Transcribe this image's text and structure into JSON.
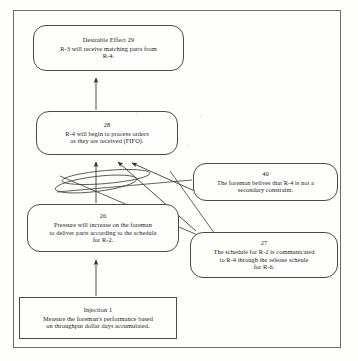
{
  "document": {
    "type": "future-reality-tree-diagram",
    "frame_border_color": "#6b6b6b",
    "node_border_color": "#4a4a4a",
    "text_color": "#1c1c1c",
    "background_color": "#fefefd"
  },
  "nodes": [
    {
      "key": "node-29",
      "id_label": "Desirable Effect 29",
      "shape": "rounded-rectangle",
      "lines": [
        "R-3 will receive matching parts from",
        "R-4."
      ]
    },
    {
      "key": "node-28",
      "id_label": "28",
      "shape": "rounded-rectangle",
      "lines": [
        "R-4 will begin to process orders",
        "as they are received (FIFO)."
      ]
    },
    {
      "key": "node-40",
      "id_label": "40",
      "shape": "rounded-rectangle",
      "lines": [
        "The foreman belives that R-4 is not a",
        "secondary constraint."
      ]
    },
    {
      "key": "node-26",
      "id_label": "26",
      "shape": "rounded-rectangle",
      "lines": [
        "Pressure will increase on the foreman",
        "to deliver parts according to the schedule",
        "for R-2."
      ]
    },
    {
      "key": "node-27",
      "id_label": "27",
      "shape": "rounded-rectangle",
      "lines": [
        "The schedule for R-2 is communicated",
        "to R-4 through the release scheule",
        "for R-6."
      ]
    },
    {
      "key": "node-inj",
      "id_label": "Injection 1",
      "shape": "rectangle",
      "lines": [
        "Measure the foreman's performance based",
        "on throughput dollar days accumulated."
      ]
    }
  ],
  "connectors": [
    {
      "name": "arrow-28-to-29",
      "from": "node-28",
      "to": "node-29",
      "style": "straight-arrow"
    },
    {
      "name": "arrow-26-to-28",
      "from": "node-26",
      "to": "node-28",
      "style": "straight-arrow"
    },
    {
      "name": "arrow-27-to-28",
      "from": "node-27",
      "to": "node-28",
      "style": "diagonal-arrow"
    },
    {
      "name": "arrow-40-to-28",
      "from": "node-40",
      "to": "node-28",
      "style": "diagonal-arrow"
    },
    {
      "name": "arrow-injection-to-26",
      "from": "node-inj",
      "to": "node-26",
      "style": "straight-arrow"
    },
    {
      "name": "and-connector-ellipse-1",
      "type": "logical-and-ellipse"
    },
    {
      "name": "and-connector-ellipse-2",
      "type": "logical-and-ellipse"
    }
  ]
}
